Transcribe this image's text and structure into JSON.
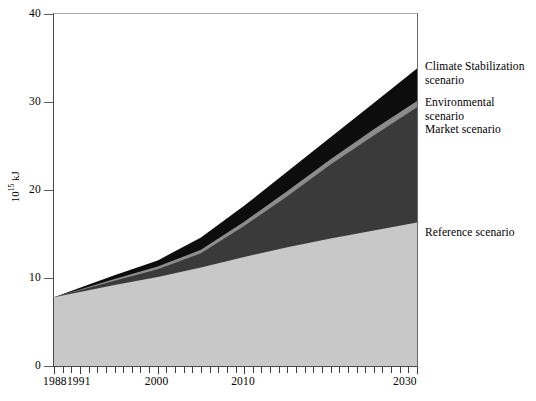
{
  "chart_data": {
    "type": "area",
    "title": "",
    "subtitle": "",
    "xlabel": "",
    "ylabel": "10^15 kJ",
    "ylabel_display": "10",
    "ylabel_exp": "15",
    "ylabel_unit": " kJ",
    "stacked": true,
    "grid": false,
    "legend_position": "right-inline-annotations",
    "xlim": [
      1988,
      2030
    ],
    "ylim": [
      0,
      40
    ],
    "yticks": [
      0,
      10,
      20,
      30,
      40
    ],
    "xticks_labeled": [
      1988,
      1991,
      2000,
      2010,
      2030
    ],
    "xtick_interval_years": 1,
    "x": [
      1988,
      1991,
      1995,
      2000,
      2005,
      2010,
      2015,
      2020,
      2025,
      2030
    ],
    "series": [
      {
        "name": "Reference scenario",
        "color": "#c8c8c8",
        "values": [
          7.8,
          8.4,
          9.2,
          10.1,
          11.2,
          12.4,
          13.5,
          14.5,
          15.4,
          16.3
        ]
      },
      {
        "name": "Market scenario",
        "color": "#3a3a3a",
        "values": [
          7.8,
          8.6,
          9.7,
          11.0,
          12.8,
          15.9,
          19.3,
          22.9,
          26.2,
          29.4
        ]
      },
      {
        "name": "Environmental scenario",
        "color": "#8c8c8c",
        "values": [
          7.8,
          8.7,
          9.9,
          11.3,
          13.2,
          16.4,
          19.9,
          23.5,
          26.9,
          30.1
        ]
      },
      {
        "name": "Climate Stabilization scenario",
        "color": "#0d0d0d",
        "values": [
          7.8,
          8.9,
          10.3,
          12.0,
          14.6,
          18.2,
          22.1,
          26.0,
          29.9,
          33.8
        ]
      }
    ],
    "annotations": [
      {
        "text": "Climate Stabilization\nscenario",
        "x_px": 425,
        "y_px": 60
      },
      {
        "text": "Environmental scenario\nMarket scenario",
        "x_px": 425,
        "y_px": 96
      },
      {
        "text": "Reference scenario",
        "x_px": 425,
        "y_px": 226
      }
    ]
  }
}
